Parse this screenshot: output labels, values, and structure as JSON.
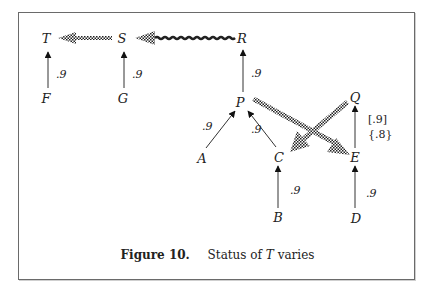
{
  "figure": {
    "number_label": "Figure 10.",
    "caption_prefix": "Status of",
    "caption_var": "T",
    "caption_suffix": "varies"
  },
  "nodes": {
    "T": "T",
    "S": "S",
    "R": "R",
    "F": "F",
    "G": "G",
    "P": "P",
    "Q": "Q",
    "A": "A",
    "C": "C",
    "E": "E",
    "B": "B",
    "D": "D"
  },
  "weights": {
    "F_T": ".9",
    "G_S": ".9",
    "P_R": ".9",
    "A_P": ".9",
    "C_P": ".9",
    "B_C": ".9",
    "D_E": ".9",
    "E_Q_a": "[.9]",
    "E_Q_b": "{.8}"
  },
  "edges": {
    "support": [
      {
        "from": "F",
        "to": "T",
        "weight": ".9"
      },
      {
        "from": "G",
        "to": "S",
        "weight": ".9"
      },
      {
        "from": "P",
        "to": "R",
        "weight": ".9"
      },
      {
        "from": "A",
        "to": "P",
        "weight": ".9"
      },
      {
        "from": "C",
        "to": "P",
        "weight": ".9"
      },
      {
        "from": "B",
        "to": "C",
        "weight": ".9"
      },
      {
        "from": "D",
        "to": "E",
        "weight": ".9"
      },
      {
        "from": "E",
        "to": "Q",
        "weight": "[.9] {.8}"
      }
    ],
    "defeat": [
      {
        "from": "S",
        "to": "T",
        "style": "checkered-dotted"
      },
      {
        "from": "R",
        "to": "S",
        "style": "checkered-wavy"
      },
      {
        "from": "P",
        "to": "E",
        "style": "checkered"
      },
      {
        "from": "Q",
        "to": "C",
        "style": "checkered"
      }
    ]
  },
  "colors": {
    "ink": "#222222",
    "border": "#6a6a6a"
  }
}
